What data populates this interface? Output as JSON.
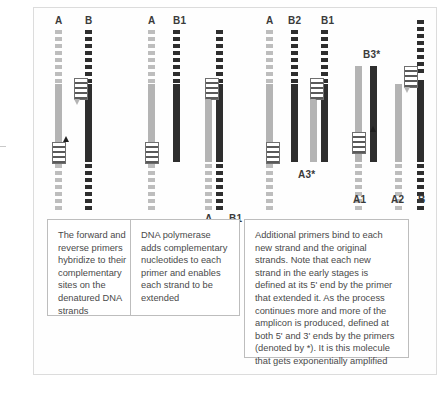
{
  "figure": {
    "title_alt": "PCR amplification cycles schematic",
    "colors": {
      "strand_a": "#b4b4b4",
      "strand_b": "#2e2e2e",
      "primer_outline": "#6f6f6f",
      "caption_border": "#bdbdbd",
      "page_border": "#dcdcdc",
      "text": "#4a4a4a"
    }
  },
  "panels": [
    {
      "id": "panel-1",
      "labels_top": [
        "A",
        "B"
      ],
      "labels_bottom": [],
      "caption": "The forward and reverse primers hybridize to their complementary sites on the denatured DNA strands"
    },
    {
      "id": "panel-2",
      "labels_top": [
        "A",
        "B1"
      ],
      "labels_bottom": [
        "A",
        "B1"
      ],
      "caption": "DNA polymerase adds complementary nucleotides to each primer and enables each strand to be extended"
    },
    {
      "id": "panel-3",
      "labels_top": [
        "A",
        "B2",
        "B1",
        "B3*"
      ],
      "labels_bottom": [
        "A3*",
        "A1",
        "A2",
        "B"
      ],
      "caption": "Additional primers bind to each new strand and the original strands. Note that each new strand in the early stages is defined at its 5' end by the primer that extended it. As the process continues more and more of the amplicon is produced, defined at both 5' and 3' ends by the primers (denoted by *). It is this molecule that gets exponentially amplified"
    }
  ],
  "strand_labels": {
    "p1_A": "A",
    "p1_B": "B",
    "p2_A": "A",
    "p2_B1": "B1",
    "p2_bot_A": "A",
    "p2_bot_B1": "B1",
    "p3_A": "A",
    "p3_B2": "B2",
    "p3_B1": "B1",
    "p3_B3star": "B3*",
    "p3_A3star": "A3*",
    "p3_A1": "A1",
    "p3_A2": "A2",
    "p3_B": "B"
  }
}
